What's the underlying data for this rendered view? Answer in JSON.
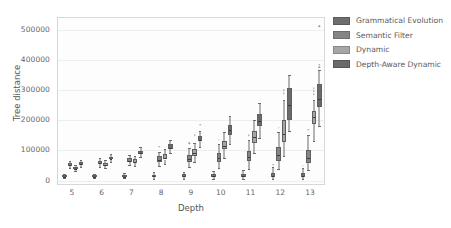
{
  "chart_data": {
    "type": "box",
    "title": "",
    "xlabel": "Depth",
    "ylabel": "Tree distance",
    "categories": [
      5,
      6,
      7,
      8,
      9,
      10,
      11,
      12,
      13
    ],
    "xtick_labels": [
      "5",
      "6",
      "7",
      "8",
      "9",
      "10",
      "11",
      "12",
      "13"
    ],
    "ytick_labels": [
      "0",
      "100000",
      "200000",
      "300000",
      "400000",
      "500000"
    ],
    "ytick_values": [
      0,
      100000,
      200000,
      300000,
      400000,
      500000
    ],
    "ylim": [
      -18000,
      540000
    ],
    "xlim": [
      0,
      9
    ],
    "grid": "horizontal",
    "legend_position": "right-outside",
    "series": [
      {
        "name": "Grammatical Evolution",
        "color": "#6e6e6e",
        "boxes": [
          {
            "depth": 5,
            "whislo": 8000,
            "q1": 12000,
            "med": 14500,
            "q3": 17000,
            "whishi": 21000,
            "fliers": []
          },
          {
            "depth": 6,
            "whislo": 8000,
            "q1": 12500,
            "med": 15000,
            "q3": 18000,
            "whishi": 23000,
            "fliers": []
          },
          {
            "depth": 7,
            "whislo": 7000,
            "q1": 12000,
            "med": 15000,
            "q3": 18500,
            "whishi": 25000,
            "fliers": []
          },
          {
            "depth": 8,
            "whislo": 6000,
            "q1": 12000,
            "med": 15500,
            "q3": 19500,
            "whishi": 27000,
            "fliers": []
          },
          {
            "depth": 9,
            "whislo": 6000,
            "q1": 12500,
            "med": 16000,
            "q3": 21000,
            "whishi": 30000,
            "fliers": []
          },
          {
            "depth": 10,
            "whislo": 5000,
            "q1": 11500,
            "med": 15500,
            "q3": 21000,
            "whishi": 32000,
            "fliers": []
          },
          {
            "depth": 11,
            "whislo": 5000,
            "q1": 11000,
            "med": 16000,
            "q3": 22000,
            "whishi": 35000,
            "fliers": []
          },
          {
            "depth": 12,
            "whislo": 4000,
            "q1": 11000,
            "med": 17000,
            "q3": 26000,
            "whishi": 44000,
            "fliers": [
              52000
            ]
          },
          {
            "depth": 13,
            "whislo": 4000,
            "q1": 10500,
            "med": 16000,
            "q3": 24000,
            "whishi": 41000,
            "fliers": [
              50000
            ]
          }
        ]
      },
      {
        "name": "Semantic Filter",
        "color": "#858585",
        "boxes": [
          {
            "depth": 5,
            "whislo": 43000,
            "q1": 50000,
            "med": 54000,
            "q3": 58000,
            "whishi": 66000,
            "fliers": []
          },
          {
            "depth": 6,
            "whislo": 45000,
            "q1": 55000,
            "med": 60000,
            "q3": 66000,
            "whishi": 76000,
            "fliers": []
          },
          {
            "depth": 7,
            "whislo": 52000,
            "q1": 62000,
            "med": 68000,
            "q3": 74000,
            "whishi": 85000,
            "fliers": []
          },
          {
            "depth": 8,
            "whislo": 48000,
            "q1": 62000,
            "med": 71000,
            "q3": 80000,
            "whishi": 96000,
            "fliers": [
              112000
            ]
          },
          {
            "depth": 9,
            "whislo": 44000,
            "q1": 62000,
            "med": 73000,
            "q3": 85000,
            "whishi": 108000,
            "fliers": [
              124000
            ]
          },
          {
            "depth": 10,
            "whislo": 42000,
            "q1": 62000,
            "med": 75000,
            "q3": 90000,
            "whishi": 120000,
            "fliers": [
              136000
            ]
          },
          {
            "depth": 11,
            "whislo": 40000,
            "q1": 64000,
            "med": 80000,
            "q3": 98000,
            "whishi": 134000,
            "fliers": [
              150000
            ]
          },
          {
            "depth": 12,
            "whislo": 38000,
            "q1": 66000,
            "med": 86000,
            "q3": 110000,
            "whishi": 160000,
            "fliers": [
              176000
            ]
          },
          {
            "depth": 13,
            "whislo": 34000,
            "q1": 60000,
            "med": 78000,
            "q3": 100000,
            "whishi": 152000,
            "fliers": [
              168000
            ]
          }
        ]
      },
      {
        "name": "Dynamic",
        "color": "#a6a6a6",
        "boxes": [
          {
            "depth": 5,
            "whislo": 32000,
            "q1": 38000,
            "med": 41000,
            "q3": 45000,
            "whishi": 52000,
            "fliers": []
          },
          {
            "depth": 6,
            "whislo": 42000,
            "q1": 50000,
            "med": 55000,
            "q3": 60000,
            "whishi": 70000,
            "fliers": []
          },
          {
            "depth": 7,
            "whislo": 50000,
            "q1": 60000,
            "med": 65000,
            "q3": 71000,
            "whishi": 82000,
            "fliers": []
          },
          {
            "depth": 8,
            "whislo": 55000,
            "q1": 70000,
            "med": 78000,
            "q3": 88000,
            "whishi": 104000,
            "fliers": []
          },
          {
            "depth": 9,
            "whislo": 62000,
            "q1": 82000,
            "med": 94000,
            "q3": 104000,
            "whishi": 126000,
            "fliers": [
              150000
            ]
          },
          {
            "depth": 10,
            "whislo": 76000,
            "q1": 104000,
            "med": 118000,
            "q3": 132000,
            "whishi": 160000,
            "fliers": []
          },
          {
            "depth": 11,
            "whislo": 92000,
            "q1": 126000,
            "med": 145000,
            "q3": 164000,
            "whishi": 200000,
            "fliers": []
          },
          {
            "depth": 12,
            "whislo": 80000,
            "q1": 128000,
            "med": 158000,
            "q3": 200000,
            "whishi": 268000,
            "fliers": [
              290000,
              300000
            ]
          },
          {
            "depth": 13,
            "whislo": 130000,
            "q1": 188000,
            "med": 212000,
            "q3": 232000,
            "whishi": 268000,
            "fliers": [
              286000,
              296000,
              306000
            ]
          }
        ]
      },
      {
        "name": "Depth-Aware Dynamic",
        "color": "#6a6a6a",
        "boxes": [
          {
            "depth": 5,
            "whislo": 46000,
            "q1": 53000,
            "med": 57000,
            "q3": 61000,
            "whishi": 68000,
            "fliers": []
          },
          {
            "depth": 6,
            "whislo": 62000,
            "q1": 70000,
            "med": 74000,
            "q3": 79000,
            "whishi": 87000,
            "fliers": []
          },
          {
            "depth": 7,
            "whislo": 78000,
            "q1": 88000,
            "med": 93000,
            "q3": 99000,
            "whishi": 110000,
            "fliers": []
          },
          {
            "depth": 8,
            "whislo": 90000,
            "q1": 104000,
            "med": 111000,
            "q3": 120000,
            "whishi": 136000,
            "fliers": []
          },
          {
            "depth": 9,
            "whislo": 112000,
            "q1": 130000,
            "med": 138000,
            "q3": 148000,
            "whishi": 166000,
            "fliers": [
              186000
            ]
          },
          {
            "depth": 10,
            "whislo": 122000,
            "q1": 152000,
            "med": 168000,
            "q3": 184000,
            "whishi": 216000,
            "fliers": []
          },
          {
            "depth": 11,
            "whislo": 142000,
            "q1": 180000,
            "med": 198000,
            "q3": 222000,
            "whishi": 258000,
            "fliers": []
          },
          {
            "depth": 12,
            "whislo": 164000,
            "q1": 202000,
            "med": 252000,
            "q3": 308000,
            "whishi": 352000,
            "fliers": []
          },
          {
            "depth": 13,
            "whislo": 182000,
            "q1": 244000,
            "med": 272000,
            "q3": 320000,
            "whishi": 368000,
            "fliers": [
              376000,
              384000,
              512000
            ]
          }
        ]
      }
    ]
  },
  "legend": {
    "entries": [
      {
        "label": "Grammatical Evolution",
        "color": "#6e6e6e"
      },
      {
        "label": "Semantic Filter",
        "color": "#858585"
      },
      {
        "label": "Dynamic",
        "color": "#a6a6a6"
      },
      {
        "label": "Depth-Aware Dynamic",
        "color": "#6a6a6a"
      }
    ]
  }
}
